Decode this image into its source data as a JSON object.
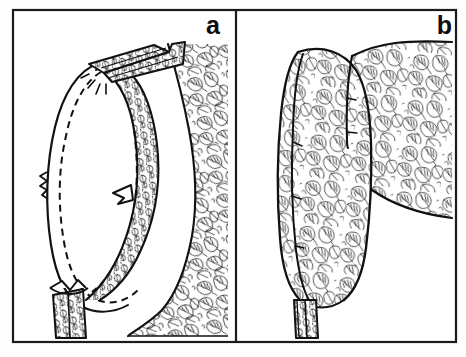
{
  "figure": {
    "type": "technical-illustration",
    "background_color": "#fefefe",
    "ink_color": "#111111",
    "frame": {
      "stroke_color": "#1a1a1a",
      "stroke_width": 2,
      "x": 12,
      "y": 9,
      "width": 445,
      "height": 334,
      "divider_x": 235
    },
    "panels": [
      {
        "id": "a",
        "label": "a",
        "label_x": 220,
        "label_y": 33,
        "caption": "Sleeve cap pinned and stitched into armhole, wrong side out, showing seam allowance and stitching line",
        "elements": [
          "armhole-opening",
          "sleeve-cap-seam",
          "dashed-stitching-line",
          "directional-arrow",
          "shoulder-seam-tab",
          "underarm-folded-tab",
          "leaf-print-bodice"
        ]
      },
      {
        "id": "b",
        "label": "b",
        "label_x": 442,
        "label_y": 33,
        "caption": "Finished sleeve turned right side out, showing smooth set-in sleeve cap and shoulder line",
        "elements": [
          "finished-sleeve",
          "shoulder-seam-line",
          "bodice-shoulder",
          "seam-allowance-strip",
          "leaf-print-fabric"
        ]
      }
    ],
    "fabric": {
      "pattern_name": "leaf-print",
      "description": "Dense all-over printed leaf motif rendered in fine black line hatching",
      "line_color": "#151515"
    },
    "line_styles": {
      "outline": "solid",
      "stitching": "dashed",
      "dash_pattern": "7 5"
    }
  }
}
